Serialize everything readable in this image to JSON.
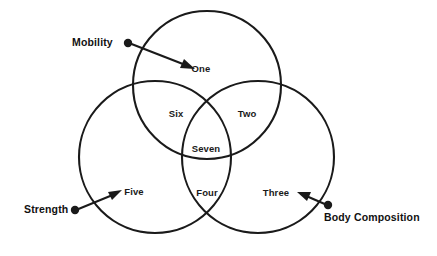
{
  "diagram": {
    "type": "venn-3-circle",
    "title": "",
    "stroke_color": "#1a1a1a",
    "background_color": "#ffffff",
    "sets": [
      {
        "id": "mobility",
        "label": "Mobility",
        "position": "top"
      },
      {
        "id": "strength",
        "label": "Strength",
        "position": "bottom-left"
      },
      {
        "id": "body_composition",
        "label": "Body Composition",
        "position": "bottom-right"
      }
    ],
    "regions": [
      {
        "id": "one",
        "label": "One",
        "belongs_to": [
          "mobility"
        ]
      },
      {
        "id": "six",
        "label": "Six",
        "belongs_to": [
          "mobility",
          "strength"
        ]
      },
      {
        "id": "two",
        "label": "Two",
        "belongs_to": [
          "mobility",
          "body_composition"
        ]
      },
      {
        "id": "seven",
        "label": "Seven",
        "belongs_to": [
          "mobility",
          "strength",
          "body_composition"
        ]
      },
      {
        "id": "five",
        "label": "Five",
        "belongs_to": [
          "strength"
        ]
      },
      {
        "id": "four",
        "label": "Four",
        "belongs_to": [
          "strength",
          "body_composition"
        ]
      },
      {
        "id": "three",
        "label": "Three",
        "belongs_to": [
          "body_composition"
        ]
      }
    ],
    "callouts": [
      {
        "id": "mobility-callout",
        "label": "Mobility",
        "points_to": "One"
      },
      {
        "id": "strength-callout",
        "label": "Strength",
        "points_to": "Five"
      },
      {
        "id": "bodycomp-callout",
        "label": "Body Composition",
        "points_to": "Three"
      }
    ]
  }
}
